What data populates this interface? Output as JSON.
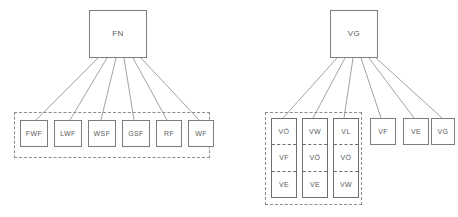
{
  "diagram": {
    "colors": {
      "background": "#ffffff",
      "box_border": "#7d7d7d",
      "group_border": "#8c8c8c",
      "edge_line": "#8a8a8a",
      "text": "#5a5a5a"
    },
    "trees": [
      {
        "id": "fn-tree",
        "root": {
          "label": "FN",
          "x": 89,
          "y": 10,
          "w": 58,
          "h": 48
        },
        "group": {
          "label": "",
          "x": 14,
          "y": 112,
          "w": 196,
          "h": 46
        },
        "leaves": [
          {
            "label": "FWF",
            "x": 20,
            "y": 120,
            "w": 28,
            "h": 27
          },
          {
            "label": "LWF",
            "x": 54,
            "y": 120,
            "w": 28,
            "h": 27
          },
          {
            "label": "WSF",
            "x": 88,
            "y": 120,
            "w": 28,
            "h": 27
          },
          {
            "label": "GSF",
            "x": 122,
            "y": 120,
            "w": 28,
            "h": 27
          },
          {
            "label": "RF",
            "x": 156,
            "y": 120,
            "w": 26,
            "h": 27
          },
          {
            "label": "WF",
            "x": 188,
            "y": 120,
            "w": 26,
            "h": 27
          }
        ]
      },
      {
        "id": "vg-tree",
        "root": {
          "label": "VG",
          "x": 330,
          "y": 10,
          "w": 48,
          "h": 48
        },
        "group": {
          "label": "",
          "x": 265,
          "y": 112,
          "w": 97,
          "h": 93
        },
        "stacks": [
          {
            "cells": [
              "VÖ",
              "VF",
              "VE"
            ],
            "x": 271,
            "y": 118,
            "w": 26,
            "h": 80
          },
          {
            "cells": [
              "VW",
              "VÖ",
              "VE"
            ],
            "x": 302,
            "y": 118,
            "w": 26,
            "h": 80
          },
          {
            "cells": [
              "VL",
              "VÖ",
              "VW"
            ],
            "x": 333,
            "y": 118,
            "w": 26,
            "h": 80
          }
        ],
        "leaves": [
          {
            "label": "VF",
            "x": 370,
            "y": 118,
            "w": 26,
            "h": 27
          },
          {
            "label": "VE",
            "x": 403,
            "y": 118,
            "w": 26,
            "h": 27
          },
          {
            "label": "VG",
            "x": 431,
            "y": 118,
            "w": 24,
            "h": 27
          }
        ]
      }
    ],
    "edges": [
      {
        "from": "FN",
        "to": "FWF",
        "x1": 98,
        "y1": 58,
        "x2": 36,
        "y2": 120
      },
      {
        "from": "FN",
        "to": "LWF",
        "x1": 107,
        "y1": 58,
        "x2": 70,
        "y2": 120
      },
      {
        "from": "FN",
        "to": "WSF",
        "x1": 116,
        "y1": 58,
        "x2": 101,
        "y2": 120
      },
      {
        "from": "FN",
        "to": "GSF",
        "x1": 124,
        "y1": 58,
        "x2": 134,
        "y2": 120
      },
      {
        "from": "FN",
        "to": "RF",
        "x1": 133,
        "y1": 58,
        "x2": 167,
        "y2": 120
      },
      {
        "from": "FN",
        "to": "WF",
        "x1": 141,
        "y1": 58,
        "x2": 199,
        "y2": 120
      },
      {
        "from": "VG",
        "to": "VÖ-stack",
        "x1": 337,
        "y1": 58,
        "x2": 283,
        "y2": 118
      },
      {
        "from": "VG",
        "to": "VW-stack",
        "x1": 345,
        "y1": 58,
        "x2": 313,
        "y2": 118
      },
      {
        "from": "VG",
        "to": "VL-stack",
        "x1": 353,
        "y1": 58,
        "x2": 344,
        "y2": 118
      },
      {
        "from": "VG",
        "to": "VF",
        "x1": 361,
        "y1": 58,
        "x2": 381,
        "y2": 118
      },
      {
        "from": "VG",
        "to": "VE",
        "x1": 369,
        "y1": 58,
        "x2": 414,
        "y2": 118
      },
      {
        "from": "VG",
        "to": "VG-leaf",
        "x1": 376,
        "y1": 58,
        "x2": 442,
        "y2": 118
      }
    ]
  }
}
